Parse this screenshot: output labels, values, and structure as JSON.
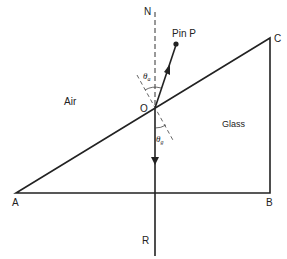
{
  "diagram": {
    "type": "refraction-through-glass-prism",
    "labels": {
      "normal": "N",
      "pin": "Pin  P",
      "point_o": "O",
      "vertex_a": "A",
      "vertex_b": "B",
      "vertex_c": "C",
      "ray_end": "R",
      "medium_air": "Air",
      "medium_glass": "Glass",
      "theta_a": "θ",
      "theta_a_sub": "a",
      "theta_g": "θ",
      "theta_g_sub": "g"
    },
    "colors": {
      "line": "#222222",
      "background": "#ffffff"
    }
  }
}
